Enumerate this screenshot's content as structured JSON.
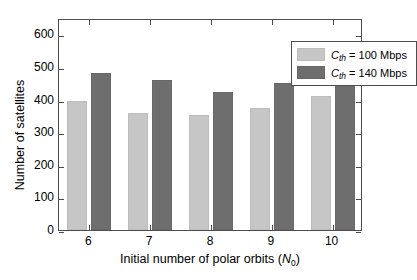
{
  "chart_data": {
    "type": "bar",
    "title": "",
    "xlabel": "Initial number of polar orbits (N0)",
    "ylabel": "Number of satellites",
    "categories": [
      "6",
      "7",
      "8",
      "9",
      "10"
    ],
    "series": [
      {
        "name": "Cth = 100 Mbps",
        "values": [
          395,
          360,
          352,
          375,
          410
        ],
        "color": "#c6c6c6"
      },
      {
        "name": "Cth = 140 Mbps",
        "values": [
          480,
          460,
          422,
          452,
          477
        ],
        "color": "#6e6e6e"
      }
    ],
    "ylim": [
      0,
      650
    ],
    "yticks": [
      0,
      100,
      200,
      300,
      400,
      500,
      600
    ],
    "ytick_labels": [
      "0",
      "100",
      "200",
      "300",
      "400",
      "500",
      "600"
    ],
    "grid": false,
    "legend_position": "top-right"
  },
  "axes": {
    "ylabel": "Number of satellites",
    "xlabel_prefix": "Initial number of polar orbits (",
    "xlabel_symbol": "N",
    "xlabel_subscript": "0",
    "xlabel_suffix": ")"
  },
  "legend": {
    "entries": [
      {
        "symbol": "C",
        "subscript": "th",
        "text": " = 100 Mbps",
        "swatch": "light-gray-swatch"
      },
      {
        "symbol": "C",
        "subscript": "th",
        "text": " = 140 Mbps",
        "swatch": "dark-gray-swatch"
      }
    ]
  }
}
